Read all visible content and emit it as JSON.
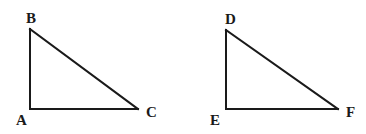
{
  "diagram": {
    "type": "geometry",
    "stroke_color": "#1a1a1a",
    "background": "#ffffff",
    "triangles": [
      {
        "name": "ABC",
        "right_angle_at": "A",
        "vertices": [
          {
            "label": "A",
            "x": 30,
            "y": 109,
            "label_x": 16,
            "label_y": 125
          },
          {
            "label": "B",
            "x": 30,
            "y": 29,
            "label_x": 26,
            "label_y": 23
          },
          {
            "label": "C",
            "x": 138,
            "y": 109,
            "label_x": 146,
            "label_y": 117
          }
        ],
        "edges": [
          [
            "A",
            "B"
          ],
          [
            "B",
            "C"
          ],
          [
            "A",
            "C"
          ]
        ]
      },
      {
        "name": "DEF",
        "right_angle_at": "E",
        "vertices": [
          {
            "label": "D",
            "x": 226,
            "y": 30,
            "label_x": 225,
            "label_y": 24
          },
          {
            "label": "E",
            "x": 226,
            "y": 109,
            "label_x": 210,
            "label_y": 125
          },
          {
            "label": "F",
            "x": 338,
            "y": 109,
            "label_x": 346,
            "label_y": 117
          }
        ],
        "edges": [
          [
            "D",
            "E"
          ],
          [
            "D",
            "F"
          ],
          [
            "E",
            "F"
          ]
        ]
      }
    ]
  }
}
